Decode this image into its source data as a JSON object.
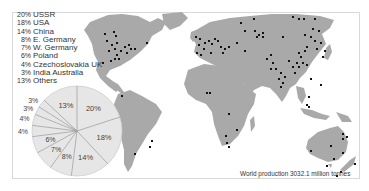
{
  "chart_data": {
    "type": "pie",
    "title": "World production 3032.1 million tonnes",
    "unit": "%",
    "start_angle": "top (12 o'clock), clockwise",
    "slices": [
      {
        "label": "USSR",
        "value": 20,
        "display": "20%"
      },
      {
        "label": "USA",
        "value": 18,
        "display": "18%"
      },
      {
        "label": "China",
        "value": 14,
        "display": "14%"
      },
      {
        "label": "E. Germany",
        "value": 8,
        "display": "8%"
      },
      {
        "label": "W. Germany",
        "value": 7,
        "display": "7%"
      },
      {
        "label": "Poland",
        "value": 6,
        "display": "6%"
      },
      {
        "label": "Czechoslovakia",
        "value": 4,
        "display": "4%"
      },
      {
        "label": "UK",
        "value": 4,
        "display": "4%"
      },
      {
        "label": "India",
        "value": 3,
        "display": "3%"
      },
      {
        "label": "Australia",
        "value": 3,
        "display": "3%"
      },
      {
        "label": "Others",
        "value": 13,
        "display": "13%"
      }
    ],
    "legend": [
      {
        "pct": "20%",
        "label": "USSR"
      },
      {
        "pct": "18%",
        "label": "USA"
      },
      {
        "pct": "14%",
        "label": "China"
      },
      {
        "pct": "8%",
        "label": "E. Germany"
      },
      {
        "pct": "7%",
        "label": "W. Germany"
      },
      {
        "pct": "6%",
        "label": "Poland"
      },
      {
        "pct": "4%",
        "label": "Czechoslovakia UK"
      },
      {
        "pct": "3%",
        "label": "India Australia"
      },
      {
        "pct": "13%",
        "label": "Others"
      }
    ],
    "legend_position": "top-left",
    "map": "world map with black dots marking production sites"
  },
  "caption": "World production 3032.1 million tonnes",
  "colors": {
    "land": "#a9a9a9",
    "dots": "#111111",
    "pie_fill": "#e6e6e6",
    "pie_lines": "#999999",
    "text": "#333333",
    "frame": "#d8d8d8"
  }
}
